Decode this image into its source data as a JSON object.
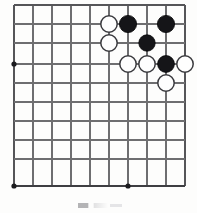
{
  "figure": {
    "kind": "go-board-diagram",
    "title": "",
    "caption": "",
    "board": {
      "columns": 10,
      "rows": 10,
      "origin_x": 14,
      "origin_y": 5,
      "spacing_x": 19,
      "spacing_y": 19,
      "bottom_edge_y": 186,
      "right_edge_x": 185,
      "colors": {
        "line": "#6e6e70",
        "edge_line": "#555558",
        "bottom_edge_line": "#3e3e42",
        "black_stone": "#151518",
        "white_stone": "#fefefe",
        "white_stone_border": "#3a3a3e",
        "background": "#fdfdfc"
      }
    },
    "vertical_lines_x": [
      14,
      33,
      52,
      71,
      90,
      109,
      128,
      147,
      166,
      185
    ],
    "horizontal_lines_y": [
      5,
      24,
      43,
      64,
      83,
      102,
      121,
      140,
      159,
      186
    ],
    "star_points": [
      {
        "name": "star-point-left",
        "x": 14,
        "y": 64,
        "r": 2.6
      },
      {
        "name": "star-point-bottom-left",
        "x": 14,
        "y": 186,
        "r": 2.6
      },
      {
        "name": "star-point-bottom-center",
        "x": 128,
        "y": 186,
        "r": 2.6
      }
    ],
    "stones": [
      {
        "name": "white-stone-1",
        "color": "white",
        "x": 109,
        "y": 24,
        "r": 8.2,
        "label": ""
      },
      {
        "name": "black-stone-1",
        "color": "black",
        "x": 128,
        "y": 24,
        "r": 8.6,
        "label": ""
      },
      {
        "name": "black-stone-2",
        "color": "black",
        "x": 166,
        "y": 24,
        "r": 8.6,
        "label": ""
      },
      {
        "name": "white-stone-2",
        "color": "white",
        "x": 109,
        "y": 43,
        "r": 8.2,
        "label": ""
      },
      {
        "name": "black-stone-3",
        "color": "black",
        "x": 147,
        "y": 43,
        "r": 8.2,
        "label": ""
      },
      {
        "name": "white-stone-3",
        "color": "white",
        "x": 128,
        "y": 64,
        "r": 8.2,
        "label": ""
      },
      {
        "name": "white-stone-4",
        "color": "white",
        "x": 147,
        "y": 64,
        "r": 8.2,
        "label": ""
      },
      {
        "name": "black-stone-4",
        "color": "black",
        "x": 166,
        "y": 64,
        "r": 8.4,
        "label": ""
      },
      {
        "name": "white-stone-5",
        "color": "white",
        "x": 185,
        "y": 64,
        "r": 8.2,
        "label": ""
      },
      {
        "name": "white-stone-6",
        "color": "white",
        "x": 166,
        "y": 83,
        "r": 8.2,
        "label": ""
      }
    ],
    "stone_counts": {
      "black": 4,
      "white": 6
    }
  }
}
